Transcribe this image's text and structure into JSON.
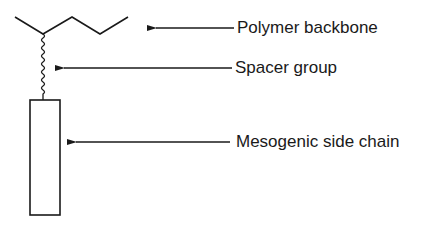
{
  "diagram": {
    "labels": {
      "backbone": "Polymer backbone",
      "spacer": "Spacer group",
      "side_chain": "Mesogenic side chain"
    },
    "colors": {
      "stroke": "#1a1a1a",
      "background": "#ffffff"
    }
  }
}
